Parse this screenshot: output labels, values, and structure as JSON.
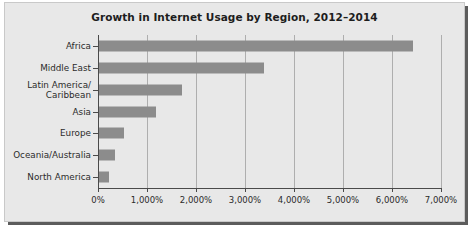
{
  "chart_data": {
    "type": "bar",
    "orientation": "horizontal",
    "title": "Growth in Internet Usage by Region, 2012–2014",
    "xlabel": "",
    "ylabel": "",
    "categories": [
      "Africa",
      "Middle East",
      "Latin America/\nCaribbean",
      "Asia",
      "Europe",
      "Oceania/Australia",
      "North America"
    ],
    "values": [
      6400,
      3370,
      1690,
      1160,
      500,
      330,
      200
    ],
    "value_unit": "percent",
    "xlim": [
      0,
      7000
    ],
    "xticks": [
      0,
      1000,
      2000,
      3000,
      4000,
      5000,
      6000,
      7000
    ],
    "xtick_labels": [
      "0%",
      "1,000%",
      "2,000%",
      "3,000%",
      "4,000%",
      "5,000%",
      "6,000%",
      "7,000%"
    ],
    "grid": "vertical",
    "legend": "none",
    "bar_color": "#8c8c8c",
    "background_color": "#e8e8e8",
    "axis_color": "#4a4a4a",
    "gridline_color": "#aeaeae",
    "title_color": "#1d1d1d"
  }
}
